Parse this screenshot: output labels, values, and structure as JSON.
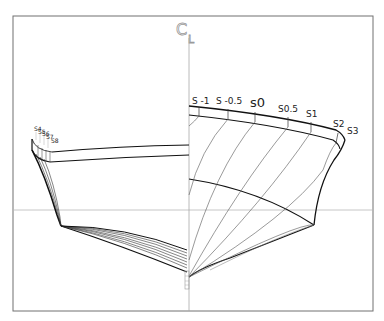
{
  "diagram": {
    "type": "ship-body-plan",
    "centerline_label": {
      "main": "C",
      "sub": "L"
    },
    "right_station_labels": [
      "S -1",
      "S -0.5",
      "s0",
      "S0.5",
      "S1",
      "S2",
      "S3"
    ],
    "left_station_labels": [
      "S4",
      "S5",
      "S6",
      "S7",
      "S8"
    ],
    "colors": {
      "frame": "#707070",
      "hull_line": "#111111",
      "station_line": "#555555",
      "reference_line": "#b8b8b8",
      "centerline_label": "#9a9a9a"
    }
  }
}
